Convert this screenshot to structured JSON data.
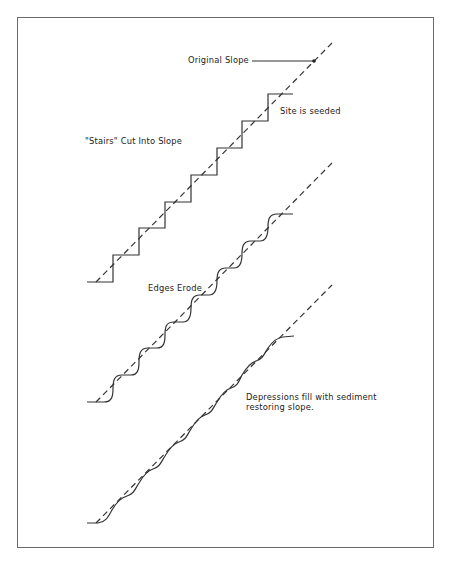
{
  "diagram": {
    "labels": {
      "original_slope": "Original Slope",
      "site_seeded": "Site is seeded",
      "stairs_cut": "\"Stairs\" Cut Into Slope",
      "edges_erode": "Edges Erode",
      "depressions_line1": "Depressions fill with sediment",
      "depressions_line2": "restoring slope."
    },
    "stages": [
      {
        "name": "Stairs cut into slope",
        "y_offset": 0
      },
      {
        "name": "Edges erode",
        "y_offset": 120
      },
      {
        "name": "Depressions fill with sediment",
        "y_offset": 241
      }
    ],
    "colors": {
      "line": "#333333",
      "frame": "#6a6a6a",
      "background": "#ffffff"
    }
  }
}
